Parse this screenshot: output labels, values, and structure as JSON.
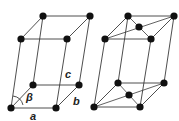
{
  "diagram": {
    "cells": [
      {
        "name": "primitive-monoclinic",
        "labels": {
          "c": "c",
          "beta": "β",
          "b": "b",
          "a": "a"
        }
      },
      {
        "name": "base-centered-monoclinic",
        "labels": {}
      }
    ],
    "colors": {
      "atom": "#111111",
      "edge": "#3a3a3a",
      "background": "#ffffff"
    }
  }
}
